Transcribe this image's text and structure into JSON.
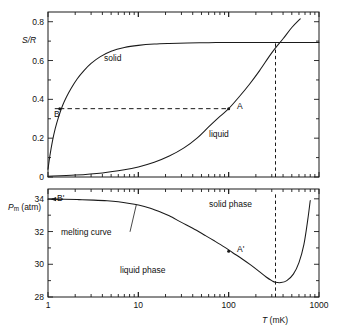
{
  "figure": {
    "kind": "two-panel-scientific-plot",
    "background": "#ffffff",
    "ink_color": "#1a1a1a"
  },
  "chart_data": [
    {
      "type": "line",
      "panel": "upper",
      "title": "",
      "xlabel": "",
      "ylabel": "S/R",
      "ylabel_parts": {
        "symbol": "S/R",
        "italic": true
      },
      "xscale": "log",
      "yscale": "linear",
      "xlim": [
        1,
        1000
      ],
      "ylim": [
        0,
        0.85
      ],
      "xticks": [
        1,
        10,
        100,
        1000
      ],
      "xticklabels": [
        "",
        "",
        "",
        ""
      ],
      "yticks": [
        0,
        0.2,
        0.4,
        0.6,
        0.8
      ],
      "yticklabels": [
        "0",
        "0.2",
        "0.4",
        "0.6",
        "0.8"
      ],
      "grid": false,
      "legend": "inline-curve-labels",
      "series": [
        {
          "name": "solid",
          "label": "solid",
          "style": "solid",
          "comment": "solid 3He nuclear spin entropy, saturates at R ln 2 = 0.693",
          "x": [
            1.0,
            1.05,
            1.12,
            1.2,
            1.3,
            1.45,
            1.6,
            1.8,
            2.1,
            2.5,
            3.0,
            3.8,
            5.0,
            7.0,
            10.0,
            15.0,
            22.0,
            35.0,
            60.0,
            100.0,
            200.0,
            400.0,
            1000.0
          ],
          "y": [
            0.04,
            0.11,
            0.185,
            0.248,
            0.305,
            0.368,
            0.412,
            0.456,
            0.505,
            0.548,
            0.585,
            0.62,
            0.648,
            0.667,
            0.678,
            0.685,
            0.688,
            0.69,
            0.692,
            0.693,
            0.693,
            0.693,
            0.693
          ]
        },
        {
          "name": "liquid",
          "label": "liquid",
          "style": "solid",
          "comment": "liquid 3He entropy, roughly linear in T at low T",
          "x": [
            1.0,
            2.0,
            4.0,
            7.0,
            10.0,
            15.0,
            22.0,
            32.0,
            45.0,
            60.0,
            80.0,
            100.0,
            130.0,
            170.0,
            220.0,
            280.0,
            330.0,
            400.0,
            500.0,
            620.0
          ],
          "y": [
            0.004,
            0.01,
            0.021,
            0.037,
            0.052,
            0.076,
            0.108,
            0.15,
            0.202,
            0.258,
            0.312,
            0.352,
            0.412,
            0.478,
            0.548,
            0.62,
            0.665,
            0.712,
            0.77,
            0.815
          ]
        }
      ],
      "annotations": [
        {
          "name": "point-A",
          "label": "A",
          "x": 100,
          "y": 0.352,
          "marker": "dot",
          "label_offset": "right"
        },
        {
          "name": "point-B",
          "label": "B",
          "x": 1.35,
          "y": 0.352,
          "marker": "dot",
          "label_offset": "below-right"
        },
        {
          "name": "isentrope",
          "label": "",
          "style": "dashed-horizontal",
          "y": 0.352,
          "x_from": 1.35,
          "x_to": 100
        },
        {
          "name": "vertical-marker",
          "label": "",
          "style": "dashed-vertical",
          "x": 330,
          "y_from": 0.0,
          "y_to": 0.693
        },
        {
          "name": "curve-label-solid",
          "label": "solid",
          "x": 5.2,
          "y": 0.605
        },
        {
          "name": "curve-label-liquid",
          "label": "liquid",
          "x": 135,
          "y": 0.245
        }
      ]
    },
    {
      "type": "line",
      "panel": "lower",
      "title": "",
      "xlabel": "T (mK)",
      "xlabel_parts": {
        "symbol": "T",
        "italic": true,
        "unit": "(mK)"
      },
      "ylabel": "Pm (atm)",
      "ylabel_parts": {
        "symbol": "P",
        "subscript": "m",
        "unit": "(atm)"
      },
      "xscale": "log",
      "yscale": "linear",
      "xlim": [
        1,
        1000
      ],
      "ylim": [
        28,
        34.6
      ],
      "xticks": [
        1,
        10,
        100,
        1000
      ],
      "xticklabels": [
        "1",
        "10",
        "100",
        "1000"
      ],
      "yticks": [
        28,
        30,
        32,
        34
      ],
      "yticklabels": [
        "28",
        "30",
        "32",
        "34"
      ],
      "grid": false,
      "series": [
        {
          "name": "melting-curve",
          "label": "melting curve",
          "style": "solid",
          "comment": "3He melting pressure with Pomeranchuk minimum near 315 mK",
          "x": [
            1.0,
            1.5,
            2.2,
            3.2,
            4.5,
            6.0,
            8.0,
            10.0,
            13.0,
            17.0,
            22.0,
            30.0,
            40.0,
            55.0,
            70.0,
            90.0,
            110.0,
            140.0,
            175.0,
            215.0,
            260.0,
            300.0,
            330.0,
            380.0,
            440.0,
            520.0,
            600.0,
            680.0,
            750.0,
            800.0
          ],
          "y": [
            33.98,
            33.97,
            33.95,
            33.92,
            33.88,
            33.82,
            33.72,
            33.62,
            33.46,
            33.22,
            32.96,
            32.56,
            32.2,
            31.76,
            31.42,
            31.05,
            30.72,
            30.34,
            29.96,
            29.58,
            29.22,
            29.0,
            28.9,
            28.88,
            29.0,
            29.4,
            30.1,
            31.2,
            32.7,
            33.9
          ]
        }
      ],
      "annotations": [
        {
          "name": "point-A-prime",
          "label": "A'",
          "x": 100,
          "y": 30.8,
          "marker": "dot",
          "label_offset": "right"
        },
        {
          "name": "point-B-prime",
          "label": "B'",
          "x": 1.2,
          "y": 33.98,
          "marker": "arrow-left",
          "label_offset": "below-right"
        },
        {
          "name": "vertical-marker",
          "label": "",
          "style": "dashed-vertical",
          "x": 330,
          "y_from": 28,
          "y_to": 34.35
        },
        {
          "name": "region-label-solid",
          "label": "solid phase",
          "x": 115,
          "y": 33.2
        },
        {
          "name": "region-label-liquid",
          "label": "liquid phase",
          "x": 13,
          "y": 29.9
        },
        {
          "name": "callout-melting-curve",
          "label": "melting curve",
          "x": 3.4,
          "y": 31.8,
          "leader_to": {
            "x": 9.5,
            "y": 33.64
          }
        }
      ]
    }
  ],
  "labels": {
    "upper_y_axis_title": "S/R",
    "lower_y_axis_title_symbol": "P",
    "lower_y_axis_title_subscript": "m",
    "lower_y_axis_title_unit": "(atm)",
    "x_axis_title_symbol": "T",
    "x_axis_title_unit": "(mK)",
    "solid_curve": "solid",
    "liquid_curve": "liquid",
    "melting_curve": "melting curve",
    "solid_phase": "solid phase",
    "liquid_phase": "liquid phase",
    "point_a": "A",
    "point_b": "B",
    "point_a_prime": "A'",
    "point_b_prime": "B'",
    "upper_yticks": [
      "0",
      "0.2",
      "0.4",
      "0.6",
      "0.8"
    ],
    "lower_yticks": [
      "28",
      "30",
      "32",
      "34"
    ],
    "xticks": [
      "1",
      "10",
      "100",
      "1000"
    ]
  }
}
